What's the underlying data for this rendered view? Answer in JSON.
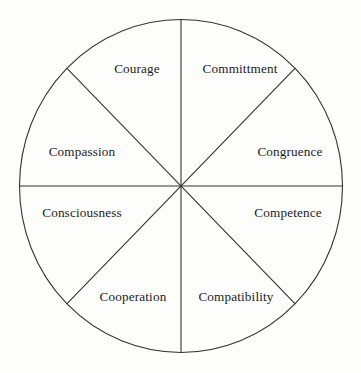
{
  "diagram": {
    "type": "pie-wheel",
    "title": "",
    "shape": "circle divided into eight equal sectors",
    "segment_count": 8,
    "colors": {
      "background": "#fdfdfb",
      "stroke": "#333333",
      "text": "#1b1b1b"
    },
    "geometry": {
      "center_x": 181,
      "center_y": 186,
      "radius_x": 162,
      "radius_y": 167,
      "divider_angles_deg": [
        0,
        45,
        90,
        135,
        180,
        225,
        270,
        315
      ]
    },
    "segments": [
      {
        "id": "committment",
        "label": "Committment",
        "position": "top-right",
        "angle_range_deg": [
          45,
          90
        ],
        "label_x": 240,
        "label_y": 69
      },
      {
        "id": "congruence",
        "label": "Congruence",
        "position": "right-upper",
        "angle_range_deg": [
          0,
          45
        ],
        "label_x": 290,
        "label_y": 152
      },
      {
        "id": "competence",
        "label": "Competence",
        "position": "right-lower",
        "angle_range_deg": [
          315,
          360
        ],
        "label_x": 288,
        "label_y": 213
      },
      {
        "id": "compatibility",
        "label": "Compatibility",
        "position": "bottom-right",
        "angle_range_deg": [
          270,
          315
        ],
        "label_x": 236,
        "label_y": 297
      },
      {
        "id": "cooperation",
        "label": "Cooperation",
        "position": "bottom-left",
        "angle_range_deg": [
          225,
          270
        ],
        "label_x": 133,
        "label_y": 297
      },
      {
        "id": "consciousness",
        "label": "Consciousness",
        "position": "left-lower",
        "angle_range_deg": [
          180,
          225
        ],
        "label_x": 82,
        "label_y": 213
      },
      {
        "id": "compassion",
        "label": "Compassion",
        "position": "left-upper",
        "angle_range_deg": [
          135,
          180
        ],
        "label_x": 82,
        "label_y": 152
      },
      {
        "id": "courage",
        "label": "Courage",
        "position": "top-left",
        "angle_range_deg": [
          90,
          135
        ],
        "label_x": 137,
        "label_y": 69
      }
    ]
  }
}
